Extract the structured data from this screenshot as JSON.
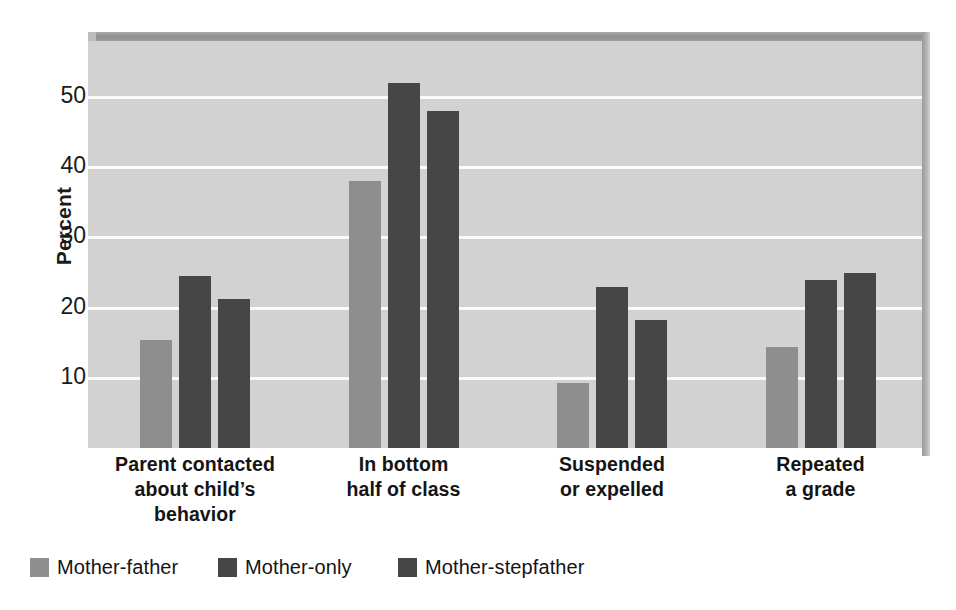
{
  "chart_data": {
    "type": "bar",
    "title": "",
    "subtitle": "",
    "xlabel": "",
    "ylabel": "Percent",
    "ylim": [
      0,
      58
    ],
    "yticks": [
      10,
      20,
      30,
      40,
      50
    ],
    "ytick_labels": [
      "10",
      "20",
      "30",
      "40",
      "50"
    ],
    "grid": true,
    "legend_position": "bottom-left",
    "categories": [
      "Parent contacted about child’s behavior",
      "In bottom half of class",
      "Suspended or expelled",
      "Repeated a grade"
    ],
    "category_label_lines": [
      [
        "Parent contacted",
        "about child’s",
        "behavior"
      ],
      [
        "In bottom",
        "half of class"
      ],
      [
        "Suspended",
        "or expelled"
      ],
      [
        "Repeated",
        "a grade"
      ]
    ],
    "series": [
      {
        "name": "Mother-father",
        "color": "#8e8e8e",
        "values": [
          15.4,
          38.0,
          9.3,
          14.4
        ]
      },
      {
        "name": "Mother-only",
        "color": "#464646",
        "values": [
          24.5,
          52.0,
          23.0,
          24.0
        ]
      },
      {
        "name": "Mother-stepfather",
        "color": "#464646",
        "values": [
          21.2,
          48.0,
          18.2,
          25.0
        ]
      }
    ]
  },
  "colors": {
    "plot_background": "#d2d2d2",
    "gridline": "#fbfbfb",
    "series_light": "#8e8e8e",
    "series_dark": "#464646",
    "page_background": "#ffffff",
    "text": "#141414"
  }
}
